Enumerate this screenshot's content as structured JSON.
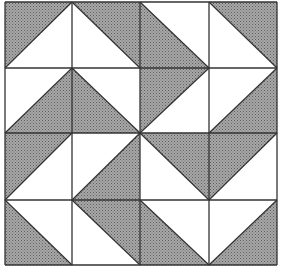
{
  "figure": {
    "grid": {
      "rows": 4,
      "cols": 4
    },
    "bounds": {
      "x0": 5,
      "y0": 2,
      "x1": 277,
      "y1": 265
    },
    "col_lines": [
      5,
      72,
      140,
      209,
      277
    ],
    "row_lines": [
      2,
      68,
      133,
      200,
      265
    ],
    "colors": {
      "shade": "#9c9c9c",
      "shade_dot": "#6a6a6a",
      "light": "#ffffff",
      "line": "#333333"
    },
    "cells": [
      [
        {
          "shaded": "TL"
        },
        {
          "shaded": "TR"
        },
        {
          "shaded": "BL"
        },
        {
          "shaded": "TR"
        }
      ],
      [
        {
          "shaded": "BR"
        },
        {
          "shaded": "BL"
        },
        {
          "shaded": "TL"
        },
        {
          "shaded": "BR"
        }
      ],
      [
        {
          "shaded": "TL"
        },
        {
          "shaded": "BR"
        },
        {
          "shaded": "TR"
        },
        {
          "shaded": "TL"
        }
      ],
      [
        {
          "shaded": "BL"
        },
        {
          "shaded": "TR"
        },
        {
          "shaded": "BL"
        },
        {
          "shaded": "BR"
        }
      ]
    ]
  }
}
